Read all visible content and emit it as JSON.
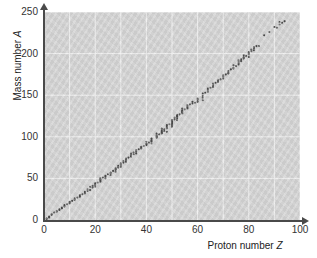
{
  "chart_data": {
    "type": "scatter",
    "title": "",
    "xlabel": "Proton number Z",
    "ylabel": "Mass number A",
    "xlabel_text": "Proton number",
    "xlabel_symbol": "Z",
    "ylabel_text": "Mass number",
    "ylabel_symbol": "A",
    "xlim": [
      0,
      100
    ],
    "ylim": [
      0,
      250
    ],
    "xticks": [
      0,
      20,
      40,
      60,
      80,
      100
    ],
    "yticks": [
      0,
      50,
      100,
      150,
      200,
      250
    ],
    "xtick_labels": [
      "0",
      "20",
      "40",
      "60",
      "80",
      "100"
    ],
    "ytick_labels": [
      "0",
      "50",
      "100",
      "150",
      "200",
      "250"
    ],
    "x_minor_step": 10,
    "y_minor_step": 50,
    "grid": true,
    "grid_color": "#efefef",
    "plot_bg": "#d0d0d0",
    "point_color": "#4a4a4a",
    "axis_color": "#4a4a4a",
    "legend": null,
    "series": [
      {
        "name": "Stable nuclides",
        "x": [
          1,
          1,
          2,
          2,
          3,
          3,
          4,
          5,
          5,
          6,
          6,
          7,
          7,
          8,
          8,
          8,
          9,
          10,
          10,
          10,
          11,
          12,
          12,
          12,
          13,
          14,
          14,
          14,
          15,
          16,
          16,
          16,
          17,
          17,
          18,
          18,
          19,
          19,
          20,
          20,
          20,
          21,
          22,
          22,
          22,
          22,
          22,
          23,
          24,
          24,
          24,
          25,
          26,
          26,
          26,
          27,
          28,
          28,
          28,
          28,
          29,
          29,
          30,
          30,
          30,
          30,
          31,
          31,
          32,
          32,
          32,
          32,
          33,
          34,
          34,
          34,
          34,
          35,
          35,
          36,
          36,
          36,
          36,
          37,
          38,
          38,
          38,
          39,
          40,
          40,
          40,
          40,
          41,
          42,
          42,
          42,
          42,
          42,
          44,
          44,
          44,
          44,
          44,
          45,
          46,
          46,
          46,
          46,
          46,
          47,
          47,
          48,
          48,
          48,
          48,
          48,
          49,
          50,
          50,
          50,
          50,
          50,
          50,
          50,
          50,
          51,
          51,
          52,
          52,
          52,
          52,
          52,
          53,
          54,
          54,
          54,
          54,
          54,
          54,
          55,
          56,
          56,
          56,
          56,
          57,
          58,
          58,
          59,
          60,
          60,
          60,
          60,
          62,
          62,
          62,
          62,
          63,
          64,
          64,
          64,
          64,
          65,
          66,
          66,
          66,
          66,
          67,
          68,
          68,
          68,
          69,
          70,
          70,
          70,
          70,
          71,
          72,
          72,
          72,
          73,
          74,
          74,
          74,
          75,
          76,
          76,
          76,
          76,
          77,
          77,
          78,
          78,
          78,
          78,
          79,
          80,
          80,
          80,
          80,
          80,
          81,
          81,
          82,
          82,
          82,
          82,
          83,
          84,
          86,
          88,
          90,
          91,
          92,
          92,
          93,
          94
        ],
        "y": [
          1,
          2,
          3,
          4,
          6,
          7,
          9,
          10,
          11,
          12,
          13,
          14,
          15,
          16,
          17,
          18,
          19,
          20,
          21,
          22,
          23,
          24,
          25,
          26,
          27,
          28,
          29,
          30,
          31,
          32,
          33,
          34,
          35,
          37,
          36,
          40,
          39,
          41,
          40,
          42,
          44,
          45,
          46,
          47,
          48,
          49,
          50,
          51,
          50,
          52,
          53,
          55,
          54,
          56,
          57,
          59,
          58,
          60,
          61,
          62,
          63,
          65,
          64,
          66,
          67,
          68,
          69,
          71,
          70,
          72,
          73,
          74,
          75,
          76,
          77,
          78,
          80,
          79,
          81,
          80,
          82,
          83,
          84,
          85,
          86,
          87,
          88,
          89,
          90,
          91,
          92,
          94,
          93,
          92,
          94,
          95,
          96,
          98,
          99,
          100,
          101,
          102,
          104,
          103,
          104,
          105,
          106,
          108,
          110,
          107,
          109,
          106,
          110,
          111,
          112,
          114,
          115,
          112,
          114,
          115,
          116,
          117,
          118,
          119,
          120,
          121,
          123,
          120,
          122,
          124,
          125,
          126,
          127,
          128,
          129,
          130,
          131,
          132,
          134,
          133,
          134,
          135,
          136,
          138,
          139,
          140,
          142,
          141,
          142,
          143,
          145,
          146,
          144,
          147,
          149,
          152,
          153,
          154,
          155,
          157,
          158,
          159,
          160,
          161,
          162,
          164,
          165,
          166,
          167,
          168,
          169,
          170,
          172,
          173,
          174,
          175,
          176,
          177,
          179,
          181,
          182,
          183,
          186,
          185,
          187,
          188,
          190,
          192,
          191,
          193,
          194,
          195,
          196,
          198,
          197,
          196,
          199,
          200,
          201,
          202,
          203,
          205,
          204,
          206,
          207,
          208,
          209,
          209,
          222,
          226,
          232,
          231,
          235,
          238,
          237,
          239
        ]
      }
    ]
  },
  "axis": {
    "y_title_text": "Mass number",
    "y_title_symbol": "A",
    "x_title_text": "Proton number",
    "x_title_symbol": "Z"
  }
}
